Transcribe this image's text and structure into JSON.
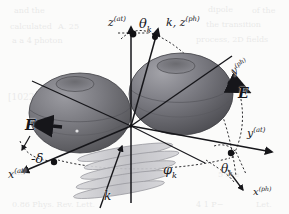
{
  "figure": {
    "kind": "3d-vector-geometry-diagram",
    "background_color": "#fbfbfa",
    "ink_color": "#16161a",
    "lobe_fill_dark": "#5f5f61",
    "lobe_fill_mid": "#74747a",
    "lobe_fill_light": "#8e8e95",
    "disk_fill": "#c9c9cc"
  },
  "labels": {
    "z_at": {
      "base": "z",
      "sup": "(at)",
      "x": 108,
      "y": 16
    },
    "theta_k_top": {
      "base": "θ",
      "sub": "k",
      "x": 139,
      "y": 17
    },
    "k_z_ph": {
      "base": "k, z",
      "sup": "(ph)",
      "x": 166,
      "y": 16
    },
    "y_ph": {
      "base": "y",
      "sup": "(ph)",
      "x": 230,
      "y": 61
    },
    "E_right": {
      "base": "E",
      "x": 238,
      "y": 86
    },
    "y_at": {
      "base": "y",
      "sup": "(at)",
      "x": 247,
      "y": 127
    },
    "theta_k_bottom": {
      "base": "θ",
      "sub": "k",
      "x": 221,
      "y": 163
    },
    "x_ph": {
      "base": "x",
      "sup": "(ph)",
      "x": 253,
      "y": 186
    },
    "phi_k": {
      "base": "φ",
      "sub": "k",
      "x": 163,
      "y": 163
    },
    "k_bottom": {
      "base": "k",
      "x": 104,
      "y": 190
    },
    "E_left": {
      "base": "E",
      "x": 25,
      "y": 118
    },
    "minus_delta": {
      "base": "-δ",
      "x": 31,
      "y": 152
    },
    "x_at": {
      "base": "x",
      "sup": "(at)",
      "x": 8,
      "y": 168
    }
  },
  "bleed_text": [
    {
      "text": "and the",
      "x": 14,
      "y": 6,
      "size": 8
    },
    {
      "text": "dipole",
      "x": 208,
      "y": 5,
      "size": 8
    },
    {
      "text": "of the",
      "x": 252,
      "y": 6,
      "size": 8
    },
    {
      "text": "calculated",
      "x": 10,
      "y": 22,
      "size": 8
    },
    {
      "text": "A. 25",
      "x": 58,
      "y": 22,
      "size": 8
    },
    {
      "text": "the transition",
      "x": 206,
      "y": 20,
      "size": 8
    },
    {
      "text": "a a 4 photon",
      "x": 12,
      "y": 36,
      "size": 8
    },
    {
      "text": "process, 2D fields",
      "x": 196,
      "y": 35,
      "size": 8
    },
    {
      "text": "[1022",
      "x": 8,
      "y": 92,
      "size": 9
    },
    {
      "text": "H",
      "x": 84,
      "y": 92,
      "size": 9
    },
    {
      "text": "and",
      "x": 10,
      "y": 168,
      "size": 8
    },
    {
      "text": "5 see",
      "x": 218,
      "y": 170,
      "size": 8
    },
    {
      "text": "0.86 Phys. Rev. Lett.",
      "x": 12,
      "y": 200,
      "size": 8
    },
    {
      "text": "4 1 P−",
      "x": 196,
      "y": 200,
      "size": 8
    },
    {
      "text": "Let.",
      "x": 256,
      "y": 200,
      "size": 8
    }
  ]
}
